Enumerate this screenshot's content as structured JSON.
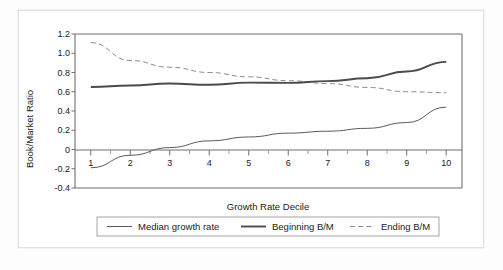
{
  "chart_data": {
    "type": "line",
    "title": "",
    "xlabel": "Growth Rate Decile",
    "ylabel": "Book/Market Ratio",
    "categories": [
      "1",
      "2",
      "3",
      "4",
      "5",
      "6",
      "7",
      "8",
      "9",
      "10"
    ],
    "x": [
      1,
      2,
      3,
      4,
      5,
      6,
      7,
      8,
      9,
      10
    ],
    "xlim": [
      0.6,
      10.4
    ],
    "ylim": [
      -0.4,
      1.2
    ],
    "yticks": [
      "1.2",
      "1.0",
      "0.8",
      "0.6",
      "0.4",
      "0.2",
      "0",
      "-0.2",
      "-0.4"
    ],
    "ytick_values": [
      1.2,
      1.0,
      0.8,
      0.6,
      0.4,
      0.2,
      0,
      -0.2,
      -0.4
    ],
    "grid": false,
    "legend_position": "below",
    "series": [
      {
        "name": "Median growth rate",
        "style": "solid-thin",
        "color": "#5a5a5a",
        "values": [
          -0.19,
          -0.06,
          0.02,
          0.09,
          0.13,
          0.17,
          0.19,
          0.22,
          0.28,
          0.44
        ]
      },
      {
        "name": "Beginning B/M",
        "style": "solid-thick",
        "color": "#4a4a4a",
        "values": [
          0.65,
          0.665,
          0.685,
          0.672,
          0.695,
          0.692,
          0.71,
          0.74,
          0.81,
          0.91
        ]
      },
      {
        "name": "Ending B/M",
        "style": "dashed",
        "color": "#7a7a7a",
        "values": [
          1.11,
          0.925,
          0.855,
          0.8,
          0.755,
          0.715,
          0.685,
          0.645,
          0.6,
          0.59
        ]
      }
    ]
  },
  "legend": {
    "items": [
      {
        "label": "Median growth rate"
      },
      {
        "label": "Beginning B/M"
      },
      {
        "label": "Ending B/M"
      }
    ]
  }
}
